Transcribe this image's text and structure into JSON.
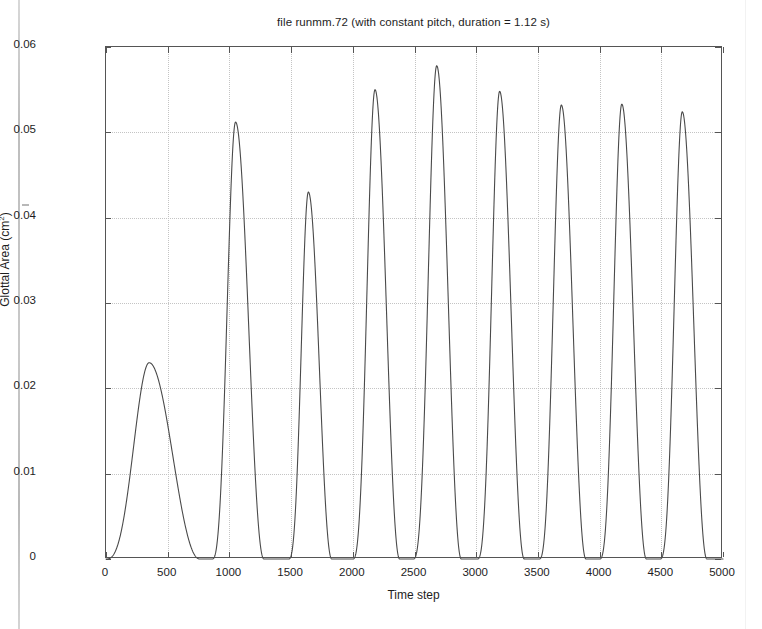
{
  "figure": {
    "title": "file runmm.72 (with constant pitch, duration = 1.12 s)",
    "x_axis_title": "Time step",
    "y_axis_title_main": "Glottal Area (cm",
    "y_axis_title_sup": "2",
    "y_axis_title_close": ")",
    "line_color": "#4a4a4a",
    "grid_color": "#c4c4c4",
    "axis_color": "#555555"
  },
  "axes": {
    "x_ticks": [
      {
        "value": 0,
        "label": "0"
      },
      {
        "value": 500,
        "label": "500"
      },
      {
        "value": 1000,
        "label": "1000"
      },
      {
        "value": 1500,
        "label": "1500"
      },
      {
        "value": 2000,
        "label": "2000"
      },
      {
        "value": 2500,
        "label": "2500"
      },
      {
        "value": 3000,
        "label": "3000"
      },
      {
        "value": 3500,
        "label": "3500"
      },
      {
        "value": 4000,
        "label": "4000"
      },
      {
        "value": 4500,
        "label": "4500"
      },
      {
        "value": 5000,
        "label": "5000"
      }
    ],
    "y_ticks": [
      {
        "value": 0,
        "label": "0"
      },
      {
        "value": 0.01,
        "label": "0.01"
      },
      {
        "value": 0.02,
        "label": "0.02"
      },
      {
        "value": 0.03,
        "label": "0.03"
      },
      {
        "value": 0.04,
        "label": "0.04"
      },
      {
        "value": 0.05,
        "label": "0.05"
      },
      {
        "value": 0.06,
        "label": "0.06"
      }
    ]
  },
  "chart_data": {
    "type": "line",
    "title": "file runmm.72 (with constant pitch, duration = 1.12 s)",
    "xlabel": "Time step",
    "ylabel": "Glottal Area (cm^2)",
    "xlim": [
      0,
      5000
    ],
    "ylim": [
      0,
      0.06
    ],
    "grid": true,
    "legend": null,
    "series": [
      {
        "name": "Glottal Area",
        "description": "Glottal area waveform: nine open/close pulses; first is a wide low-amplitude startup transient, subsequent pulses are narrow and near-periodic with a closed (zero) phase between them.",
        "pulses": [
          {
            "index": 1,
            "peak_time": 350,
            "peak_value": 0.023,
            "open_start": 0,
            "open_end": 760,
            "width": 760,
            "shape": "wide startup transient"
          },
          {
            "index": 2,
            "peak_time": 1050,
            "peak_value": 0.0512,
            "open_start": 860,
            "open_end": 1280,
            "width": 420,
            "shape": "narrow pulse"
          },
          {
            "index": 3,
            "peak_time": 1640,
            "peak_value": 0.043,
            "open_start": 1480,
            "open_end": 1830,
            "width": 350,
            "shape": "narrow pulse"
          },
          {
            "index": 4,
            "peak_time": 2180,
            "peak_value": 0.055,
            "open_start": 2000,
            "open_end": 2380,
            "width": 380,
            "shape": "narrow pulse"
          },
          {
            "index": 5,
            "peak_time": 2680,
            "peak_value": 0.0578,
            "open_start": 2490,
            "open_end": 2880,
            "width": 390,
            "shape": "tallest pulse"
          },
          {
            "index": 6,
            "peak_time": 3190,
            "peak_value": 0.0548,
            "open_start": 3010,
            "open_end": 3390,
            "width": 380,
            "shape": "narrow pulse"
          },
          {
            "index": 7,
            "peak_time": 3690,
            "peak_value": 0.0532,
            "open_start": 3510,
            "open_end": 3890,
            "width": 380,
            "shape": "narrow pulse"
          },
          {
            "index": 8,
            "peak_time": 4180,
            "peak_value": 0.0533,
            "open_start": 4000,
            "open_end": 4380,
            "width": 380,
            "shape": "narrow pulse"
          },
          {
            "index": 9,
            "peak_time": 4670,
            "peak_value": 0.0524,
            "open_start": 4490,
            "open_end": 4870,
            "width": 380,
            "shape": "narrow pulse"
          }
        ],
        "peak_times": [
          350,
          1050,
          1640,
          2180,
          2680,
          3190,
          3690,
          4180,
          4670
        ],
        "peak_values": [
          0.023,
          0.0512,
          0.043,
          0.055,
          0.0578,
          0.0548,
          0.0532,
          0.0533,
          0.0524
        ],
        "baseline_value": 0.0
      }
    ]
  }
}
